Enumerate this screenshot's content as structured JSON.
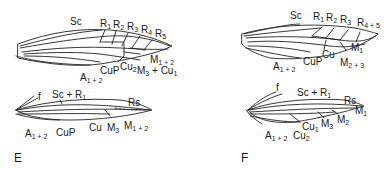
{
  "panels": [
    {
      "id": "E",
      "label": "E",
      "forewing_labels": {
        "sc": "Sc",
        "r1": "R",
        "r1_sub": "1",
        "r2": "R",
        "r2_sub": "2",
        "r3": "R",
        "r3_sub": "3",
        "r4": "R",
        "r4_sub": "4",
        "r5": "R",
        "r5_sub": "5",
        "m12": "M",
        "m12_sub": "1 + 2",
        "m3cu1": "M",
        "m3cu1_sub": "3",
        "m3cu1_rest": " + Cu",
        "m3cu1_sub2": "1",
        "cu2": "Cu",
        "cu2_sub": "2",
        "cup": "CuP",
        "a12": "A",
        "a12_sub": "1 + 2"
      },
      "hindwing_labels": {
        "f": "f",
        "scr1": "Sc + R",
        "scr1_sub": "1",
        "rs": "Rs",
        "a12": "A",
        "a12_sub": "1 + 2",
        "cup": "CuP",
        "cu": "Cu",
        "m3": "M",
        "m3_sub": "3",
        "m12": "M",
        "m12_sub": "1 + 2"
      }
    },
    {
      "id": "F",
      "label": "F",
      "forewing_labels": {
        "sc": "Sc",
        "r1": "R",
        "r1_sub": "1",
        "r2": "R",
        "r2_sub": "2",
        "r3": "R",
        "r3_sub": "3",
        "r45": "R",
        "r45_sub": "4 + 5",
        "m1": "M",
        "m1_sub": "1",
        "m23": "M",
        "m23_sub": "2 + 3",
        "cu": "Cu",
        "cup": "CuP",
        "a12": "A",
        "a12_sub": "1 + 2"
      },
      "hindwing_labels": {
        "f": "f",
        "scr1": "Sc + R",
        "scr1_sub": "1",
        "rs": "Rs",
        "m1": "M",
        "m1_sub": "1",
        "m2": "M",
        "m2_sub": "2",
        "m3": "M",
        "m3_sub": "3",
        "cu1": "Cu",
        "cu1_sub": "1",
        "a12": "A",
        "a12_sub": "1 + 2",
        "cu2": "Cu",
        "cu2_sub": "2"
      }
    }
  ]
}
